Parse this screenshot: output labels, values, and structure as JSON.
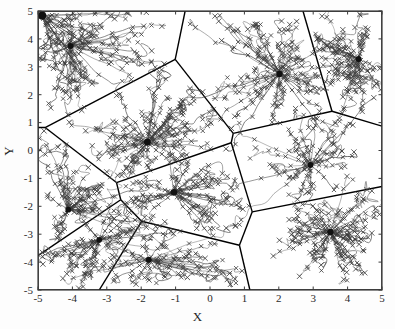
{
  "figure": {
    "type": "voronoi-trajectory-plot",
    "xlabel": "X",
    "ylabel": "Y"
  },
  "chart_data": {
    "type": "scatter",
    "title": "",
    "xlabel": "X",
    "ylabel": "Y",
    "xlim": [
      -5,
      5
    ],
    "ylim": [
      -5,
      5
    ],
    "xticks": [
      -5,
      -4,
      -3,
      -2,
      -1,
      0,
      1,
      2,
      3,
      4,
      5
    ],
    "yticks": [
      -5,
      -4,
      -3,
      -2,
      -1,
      0,
      1,
      2,
      3,
      4,
      5
    ],
    "xticklabels": [
      "-5",
      "-4",
      "-3",
      "-2",
      "-1",
      "0",
      "1",
      "2",
      "3",
      "4",
      "5"
    ],
    "yticklabels": [
      "-5",
      "-4",
      "-3",
      "-2",
      "-1",
      "0",
      "1",
      "2",
      "3",
      "4",
      "5"
    ],
    "grid": false,
    "legend": null,
    "frame_color": "#3c3c3c",
    "series": [
      {
        "name": "cluster centers",
        "marker": "filled-circle",
        "color": "#111111",
        "points": [
          [
            -4.88,
            4.84
          ],
          [
            -4.05,
            3.75
          ],
          [
            -1.82,
            0.3
          ],
          [
            2.02,
            2.74
          ],
          [
            4.32,
            3.28
          ],
          [
            2.92,
            -0.52
          ],
          [
            -4.12,
            -2.12
          ],
          [
            -1.05,
            -1.5
          ],
          [
            -3.22,
            -3.2
          ],
          [
            -1.78,
            -3.92
          ],
          [
            3.5,
            -2.92
          ]
        ]
      },
      {
        "name": "data points",
        "marker": "x-cross",
        "color": "#3a3a3a",
        "count": 420
      },
      {
        "name": "trajectories",
        "marker": "line",
        "color": "#4a4a4a",
        "description": "mean-shift style convergence paths from each data point toward its cluster center"
      }
    ],
    "voronoi_boundaries": {
      "color": "#000000",
      "width": 1.4,
      "generator_points": [
        [
          -4.05,
          3.75
        ],
        [
          -1.82,
          0.3
        ],
        [
          2.02,
          2.74
        ],
        [
          4.32,
          3.28
        ],
        [
          2.92,
          -0.52
        ],
        [
          -4.12,
          -2.12
        ],
        [
          -1.05,
          -1.5
        ],
        [
          -3.22,
          -3.2
        ],
        [
          -1.78,
          -3.92
        ],
        [
          3.5,
          -2.92
        ]
      ]
    }
  }
}
